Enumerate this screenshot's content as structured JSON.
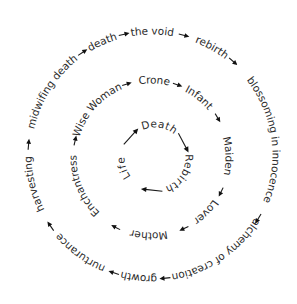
{
  "diagram": {
    "title": "",
    "colors": {
      "text": "#2b2b2b",
      "arrow": "#111111",
      "background": "#ffffff"
    },
    "rings": [
      {
        "id": "outer",
        "center": [
          152,
          155
        ],
        "radius": 124,
        "labels": [
          {
            "text": "the void",
            "angle": 0
          },
          {
            "text": "rebirth",
            "angle": 29
          },
          {
            "text": "blossoming in innocence",
            "angle": 82
          },
          {
            "text": "alchemy of creation",
            "angle": 146
          },
          {
            "text": "growth",
            "angle": 186
          },
          {
            "text": "nurturance",
            "angle": 216
          },
          {
            "text": "harvesting",
            "angle": 256
          },
          {
            "text": "midwifing death",
            "angle": 302
          },
          {
            "text": "death",
            "angle": 336
          }
        ],
        "arrows": [
          {
            "angle": 15,
            "length": 11
          },
          {
            "angle": 41,
            "length": 11
          },
          {
            "angle": 121,
            "length": 11
          },
          {
            "angle": 174,
            "length": 11
          },
          {
            "angle": 198,
            "length": 11
          },
          {
            "angle": 235,
            "length": 11
          },
          {
            "angle": 275,
            "length": 11
          },
          {
            "angle": 326,
            "length": 11
          },
          {
            "angle": 347,
            "length": 11
          }
        ]
      },
      {
        "id": "middle",
        "center": [
          151,
          158
        ],
        "radius": 78,
        "labels": [
          {
            "text": "Crone",
            "angle": 2
          },
          {
            "text": "Infant",
            "angle": 38
          },
          {
            "text": "Maiden",
            "angle": 88
          },
          {
            "text": "Lover",
            "angle": 134
          },
          {
            "text": "Mother",
            "angle": 181
          },
          {
            "text": "Enchantress",
            "angle": 247
          },
          {
            "text": "Wise Woman",
            "angle": 311
          }
        ],
        "arrows": [
          {
            "angle": 20,
            "length": 10
          },
          {
            "angle": 59,
            "length": 10
          },
          {
            "angle": 116,
            "length": 10
          },
          {
            "angle": 155,
            "length": 10
          },
          {
            "angle": 207,
            "length": 10
          },
          {
            "angle": 283,
            "length": 10
          },
          {
            "angle": 342,
            "length": 10
          }
        ]
      },
      {
        "id": "inner",
        "center": [
          155,
          158
        ],
        "radius": 34,
        "labels": [
          {
            "text": "Death",
            "angle": 8
          },
          {
            "text": "Rebirth",
            "angle": 122
          },
          {
            "text": "Life",
            "angle": 252
          }
        ],
        "arrows": [
          {
            "angle": 62,
            "length": 22
          },
          {
            "angle": 186,
            "length": 22
          },
          {
            "angle": 312,
            "length": 22
          }
        ]
      }
    ]
  }
}
